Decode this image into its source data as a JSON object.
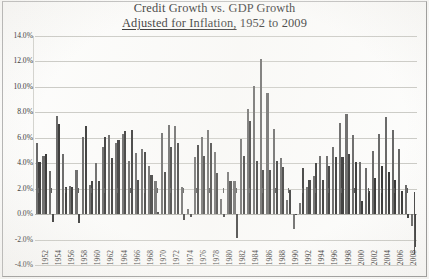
{
  "title": {
    "line1": "Credit Growth vs. GDP Growth",
    "line2_underlined": "Adjusted for Inflation,",
    "line2_rest": " 1952 to 2009"
  },
  "axis": {
    "y_ticks": [
      "14.0%",
      "12.0%",
      "10.0%",
      "8.0%",
      "6.0%",
      "4.0%",
      "2.0%",
      "0.0%",
      "-2.0%",
      "-4.0%"
    ],
    "x_ticks": [
      "1952",
      "1954",
      "1956",
      "1958",
      "1960",
      "1962",
      "1964",
      "1966",
      "1968",
      "1970",
      "1972",
      "1974",
      "1976",
      "1978",
      "1980",
      "1982",
      "1984",
      "1986",
      "1988",
      "1990",
      "1992",
      "1994",
      "1996",
      "1998",
      "2000",
      "2002",
      "2004",
      "2006",
      "2008"
    ]
  },
  "colors": {
    "credit_bar": "#5d5d5d",
    "gdp_bar": "#2a2a2a",
    "gridline": "#c9c9c4",
    "frame": "#8c8c8c",
    "text": "#1a1a1a"
  },
  "chart_data": {
    "type": "bar",
    "title": "Credit Growth vs. GDP Growth Adjusted for Inflation, 1952 to 2009",
    "xlabel": "",
    "ylabel": "",
    "ylim": [
      -4.0,
      14.0
    ],
    "ytick_step": 2.0,
    "grid": true,
    "legend": "none",
    "x_axis_label_interval": 2,
    "categories": [
      1952,
      1953,
      1954,
      1955,
      1956,
      1957,
      1958,
      1959,
      1960,
      1961,
      1962,
      1963,
      1964,
      1965,
      1966,
      1967,
      1968,
      1969,
      1970,
      1971,
      1972,
      1973,
      1974,
      1975,
      1976,
      1977,
      1978,
      1979,
      1980,
      1981,
      1982,
      1983,
      1984,
      1985,
      1986,
      1987,
      1988,
      1989,
      1990,
      1991,
      1992,
      1993,
      1994,
      1995,
      1996,
      1997,
      1998,
      1999,
      2000,
      2001,
      2002,
      2003,
      2004,
      2005,
      2006,
      2007,
      2008,
      2009
    ],
    "series": [
      {
        "name": "Credit Growth",
        "values": [
          5.6,
          4.6,
          3.4,
          7.7,
          4.7,
          2.2,
          3.5,
          6.1,
          2.3,
          4.0,
          5.3,
          6.2,
          5.6,
          6.3,
          4.2,
          4.8,
          5.1,
          3.8,
          2.6,
          6.4,
          7.0,
          6.9,
          2.1,
          0.4,
          4.5,
          6.1,
          6.6,
          4.9,
          1.2,
          3.3,
          2.6,
          5.9,
          8.3,
          10.1,
          12.2,
          9.5,
          6.7,
          4.4,
          1.1,
          -1.2,
          0.9,
          2.1,
          3.0,
          4.6,
          4.6,
          5.3,
          7.2,
          7.9,
          6.2,
          4.1,
          3.6,
          5.0,
          6.3,
          7.6,
          6.6,
          5.1,
          2.3,
          -0.9
        ]
      },
      {
        "name": "GDP Growth",
        "values": [
          4.1,
          4.7,
          -0.6,
          7.1,
          2.1,
          2.1,
          -0.7,
          6.9,
          2.6,
          2.6,
          6.1,
          4.4,
          5.8,
          6.5,
          6.6,
          2.7,
          4.9,
          3.1,
          0.2,
          3.3,
          5.3,
          5.6,
          -0.5,
          -0.2,
          5.4,
          4.6,
          5.6,
          3.2,
          -0.2,
          2.6,
          -1.9,
          4.6,
          7.3,
          4.2,
          3.5,
          3.5,
          4.2,
          3.7,
          1.9,
          -0.1,
          3.6,
          2.7,
          4.0,
          2.7,
          3.8,
          4.5,
          4.5,
          4.7,
          4.1,
          1.0,
          1.8,
          2.8,
          3.8,
          3.3,
          2.7,
          1.8,
          -0.3,
          -2.6
        ]
      }
    ]
  }
}
